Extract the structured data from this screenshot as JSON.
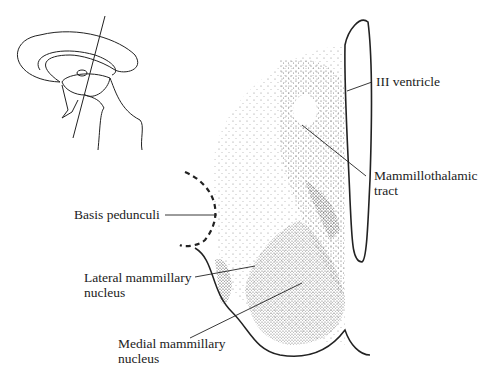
{
  "diagram": {
    "type": "anatomical illustration",
    "labels": {
      "iii_ventricle": "III ventricle",
      "mammillothalamic_line1": "Mammillothalamic",
      "mammillothalamic_line2": "tract",
      "basis_pedunculi": "Basis pedunculi",
      "lateral_line1": "Lateral mammillary",
      "lateral_line2": "nucleus",
      "medial_line1": "Medial mammillary",
      "medial_line2": "nucleus"
    },
    "colors": {
      "ink": "#222222",
      "background": "#ffffff"
    }
  }
}
